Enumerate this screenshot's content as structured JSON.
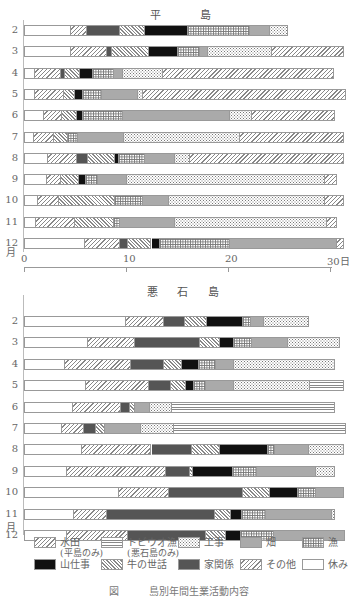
{
  "chart_data": [
    {
      "type": "bar",
      "orientation": "horizontal-stacked",
      "title": "平　島",
      "xlabel": "日",
      "ylabel": "月",
      "xlim": [
        0,
        31
      ],
      "xticks": [
        "0",
        "10",
        "20",
        "30日"
      ],
      "categories": [
        "2",
        "3",
        "4",
        "5",
        "6",
        "7",
        "8",
        "9",
        "10",
        "11",
        "12"
      ],
      "rows": [
        {
          "month": "2",
          "segments": [
            [
              "rest",
              4.6
            ],
            [
              "rice",
              1.6
            ],
            [
              "house",
              3.2
            ],
            [
              "cattle",
              2.5
            ],
            [
              "mountain",
              4.2
            ],
            [
              "fish",
              6.1
            ],
            [
              "field",
              1.9
            ],
            [
              "constr",
              1.8
            ]
          ]
        },
        {
          "month": "3",
          "segments": [
            [
              "rest",
              4.6
            ],
            [
              "rice",
              3.5
            ],
            [
              "house",
              0.5
            ],
            [
              "cattle",
              3.7
            ],
            [
              "mountain",
              2.8
            ],
            [
              "fish",
              2.2
            ],
            [
              "field",
              0.7
            ],
            [
              "constr",
              6.3
            ],
            [
              "other",
              7.1
            ]
          ]
        },
        {
          "month": "4",
          "segments": [
            [
              "rest",
              1.1
            ],
            [
              "rice",
              2.5
            ],
            [
              "house",
              0.4
            ],
            [
              "cattle",
              1.5
            ],
            [
              "mountain",
              1.3
            ],
            [
              "fish",
              2.0
            ],
            [
              "field",
              0.9
            ],
            [
              "constr",
              3.9
            ],
            [
              "other",
              16.8
            ]
          ]
        },
        {
          "month": "5",
          "segments": [
            [
              "rest",
              1.1
            ],
            [
              "rice",
              2.8
            ],
            [
              "cattle",
              1.1
            ],
            [
              "mountain",
              0.8
            ],
            [
              "fish",
              1.8
            ],
            [
              "field",
              3.6
            ],
            [
              "constr",
              0.5
            ],
            [
              "other",
              19.9
            ]
          ]
        },
        {
          "month": "6",
          "segments": [
            [
              "rest",
              2.0
            ],
            [
              "rice",
              1.7
            ],
            [
              "cattle",
              1.5
            ],
            [
              "mountain",
              0.6
            ],
            [
              "fish",
              3.9
            ],
            [
              "field",
              10.5
            ],
            [
              "constr",
              2.2
            ],
            [
              "other",
              8.1
            ]
          ]
        },
        {
          "month": "7",
          "segments": [
            [
              "rest",
              1.0
            ],
            [
              "rice",
              1.9
            ],
            [
              "cattle",
              1.4
            ],
            [
              "fish",
              1.0
            ],
            [
              "field",
              4.5
            ],
            [
              "constr",
              11.4
            ],
            [
              "other",
              10.2
            ]
          ]
        },
        {
          "month": "8",
          "segments": [
            [
              "rest",
              2.4
            ],
            [
              "rice",
              2.8
            ],
            [
              "house",
              1.1
            ],
            [
              "cattle",
              2.6
            ],
            [
              "mountain",
              0.4
            ],
            [
              "fish",
              2.6
            ],
            [
              "field",
              2.9
            ],
            [
              "constr",
              1.5
            ],
            [
              "other",
              15.1
            ]
          ]
        },
        {
          "month": "9",
          "segments": [
            [
              "rest",
              2.3
            ],
            [
              "rice",
              1.3
            ],
            [
              "cattle",
              1.8
            ],
            [
              "mountain",
              0.7
            ],
            [
              "fish",
              1.2
            ],
            [
              "field",
              2.8
            ],
            [
              "constr",
              19.4
            ],
            [
              "other",
              1.2
            ]
          ]
        },
        {
          "month": "10",
          "segments": [
            [
              "rest",
              1.4
            ],
            [
              "rice",
              2.0
            ],
            [
              "cattle",
              5.5
            ],
            [
              "fish",
              2.8
            ],
            [
              "field",
              2.5
            ],
            [
              "constr",
              15.3
            ],
            [
              "other",
              1.9
            ]
          ]
        },
        {
          "month": "11",
          "segments": [
            [
              "rest",
              1.2
            ],
            [
              "rice",
              3.8
            ],
            [
              "cattle",
              3.8
            ],
            [
              "fish",
              0.6
            ],
            [
              "field",
              5.4
            ],
            [
              "constr",
              14.9
            ],
            [
              "other",
              1.0
            ]
          ]
        },
        {
          "month": "12",
          "segments": [
            [
              "rest",
              6.0
            ],
            [
              "rice",
              3.4
            ],
            [
              "house",
              0.8
            ],
            [
              "cattle",
              2.3
            ],
            [
              "mountain",
              0.8
            ],
            [
              "fish",
              6.9
            ],
            [
              "field",
              10.5
            ],
            [
              "other",
              0.7
            ]
          ]
        }
      ]
    },
    {
      "type": "bar",
      "orientation": "horizontal-stacked",
      "title": "悪 石 島",
      "xlabel": "日",
      "ylabel": "月",
      "xlim": [
        0,
        31
      ],
      "categories": [
        "2",
        "3",
        "4",
        "5",
        "6",
        "7",
        "8",
        "9",
        "10",
        "11",
        "12"
      ],
      "rows": [
        {
          "month": "2",
          "segments": [
            [
              "rest",
              10.0
            ],
            [
              "rice",
              3.7
            ],
            [
              "house",
              2.1
            ],
            [
              "cattle",
              2.1
            ],
            [
              "mountain",
              3.6
            ],
            [
              "fish",
              0.8
            ],
            [
              "field",
              1.2
            ],
            [
              "constr",
              4.4
            ]
          ]
        },
        {
          "month": "3",
          "segments": [
            [
              "rest",
              6.3
            ],
            [
              "rice",
              4.6
            ],
            [
              "house",
              6.4
            ],
            [
              "cattle",
              1.9
            ],
            [
              "mountain",
              1.4
            ],
            [
              "fish",
              1.8
            ],
            [
              "field",
              3.5
            ],
            [
              "constr",
              5.1
            ]
          ]
        },
        {
          "month": "4",
          "segments": [
            [
              "rest",
              4.0
            ],
            [
              "rice",
              6.5
            ],
            [
              "house",
              3.2
            ],
            [
              "cattle",
              1.8
            ],
            [
              "mountain",
              1.7
            ],
            [
              "fish",
              1.6
            ],
            [
              "field",
              1.8
            ],
            [
              "constr",
              9.9
            ]
          ]
        },
        {
          "month": "5",
          "segments": [
            [
              "rest",
              6.1
            ],
            [
              "rice",
              6.2
            ],
            [
              "house",
              2.1
            ],
            [
              "cattle",
              1.5
            ],
            [
              "mountain",
              0.8
            ],
            [
              "fish",
              1.1
            ],
            [
              "field",
              2.8
            ],
            [
              "constr",
              7.4
            ],
            [
              "tobi",
              3.4
            ]
          ]
        },
        {
          "month": "6",
          "segments": [
            [
              "rest",
              4.8
            ],
            [
              "rice",
              4.7
            ],
            [
              "house",
              0.9
            ],
            [
              "cattle",
              0.5
            ],
            [
              "field",
              1.5
            ],
            [
              "constr",
              2.1
            ],
            [
              "tobi",
              16.0
            ]
          ]
        },
        {
          "month": "7",
          "segments": [
            [
              "rest",
              3.7
            ],
            [
              "rice",
              2.2
            ],
            [
              "house",
              1.2
            ],
            [
              "cattle",
              0.8
            ],
            [
              "field",
              3.6
            ],
            [
              "constr",
              3.2
            ],
            [
              "tobi",
              16.9
            ]
          ]
        },
        {
          "month": "8",
          "segments": [
            [
              "rest",
              5.7
            ],
            [
              "rice",
              6.8
            ],
            [
              "house",
              4.0
            ],
            [
              "cattle",
              2.7
            ],
            [
              "mountain",
              4.7
            ],
            [
              "fish",
              0.7
            ],
            [
              "field",
              3.3
            ],
            [
              "constr",
              3.5
            ]
          ]
        },
        {
          "month": "9",
          "segments": [
            [
              "rest",
              4.2
            ],
            [
              "rice",
              9.7
            ],
            [
              "house",
              2.4
            ],
            [
              "cattle",
              0.3
            ],
            [
              "mountain",
              3.9
            ],
            [
              "fish",
              2.3
            ],
            [
              "field",
              5.8
            ],
            [
              "constr",
              1.9
            ]
          ]
        },
        {
          "month": "10",
          "segments": [
            [
              "rest",
              9.3
            ],
            [
              "rice",
              4.9
            ],
            [
              "house",
              7.3
            ],
            [
              "cattle",
              2.6
            ],
            [
              "mountain",
              2.8
            ],
            [
              "fish",
              1.7
            ],
            [
              "field",
              2.8
            ]
          ]
        },
        {
          "month": "11",
          "segments": [
            [
              "rest",
              4.9
            ],
            [
              "rice",
              3.2
            ],
            [
              "house",
              10.6
            ],
            [
              "cattle",
              1.6
            ],
            [
              "mountain",
              1.1
            ],
            [
              "fish",
              2.3
            ],
            [
              "field",
              6.5
            ],
            [
              "constr",
              0.3
            ]
          ]
        },
        {
          "month": "12",
          "segments": [
            [
              "rest",
              4.2
            ],
            [
              "rice",
              6.0
            ],
            [
              "house",
              7.6
            ],
            [
              "cattle",
              2.0
            ],
            [
              "mountain",
              1.5
            ],
            [
              "fish",
              3.2
            ],
            [
              "field",
              7.0
            ]
          ]
        }
      ]
    }
  ],
  "top": {
    "title": "平　島",
    "months": [
      "2",
      "3",
      "4",
      "5",
      "6",
      "7",
      "8",
      "9",
      "10",
      "11",
      "12"
    ],
    "month_unit": "月",
    "ticks": [
      {
        "v": 0,
        "label": "0"
      },
      {
        "v": 10,
        "label": "10"
      },
      {
        "v": 20,
        "label": "20"
      },
      {
        "v": 30,
        "label": "30日"
      }
    ]
  },
  "bottom": {
    "title": "悪 石 島",
    "months": [
      "2",
      "3",
      "4",
      "5",
      "6",
      "7",
      "8",
      "9",
      "10",
      "11",
      "12"
    ],
    "month_unit": "月"
  },
  "legend": {
    "items": [
      {
        "key": "rice",
        "label": "水田",
        "sub": "(平島のみ)"
      },
      {
        "key": "tobi",
        "label": "トビウオ漁",
        "sub": "(悪石島のみ)"
      },
      {
        "key": "constr",
        "label": "工事"
      },
      {
        "key": "field",
        "label": "畑"
      },
      {
        "key": "fish",
        "label": "漁"
      },
      {
        "key": "mountain",
        "label": "山仕事"
      },
      {
        "key": "cattle",
        "label": "牛の世話"
      },
      {
        "key": "house",
        "label": "家関係"
      },
      {
        "key": "other",
        "label": "その他"
      },
      {
        "key": "rest",
        "label": "休み"
      }
    ]
  },
  "caption": "図　　　島別年間生業活動内容"
}
